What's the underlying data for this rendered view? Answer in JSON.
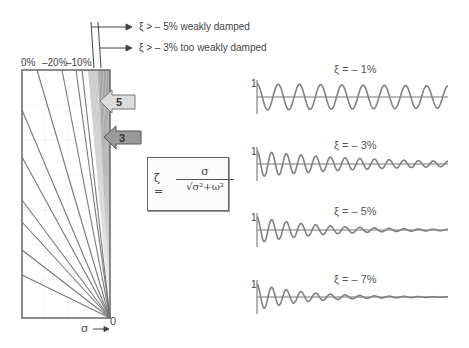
{
  "diagram": {
    "top_labels": {
      "weakly_damped": "ξ > – 5% weakly damped",
      "too_weakly_damped": "ξ > – 3% too weakly damped"
    },
    "ratio_labels": {
      "zero": "0%",
      "minus20": "–20%",
      "minus10": "–10%"
    },
    "arrow_labels": {
      "five": "5",
      "three": "3"
    },
    "axis": {
      "sigma_label": "σ",
      "origin_label": "0"
    },
    "formula": {
      "lhs": "ζ =",
      "numerator": "σ",
      "denominator": "√σ²+ω²"
    },
    "colors": {
      "line": "#777777",
      "frame": "#666666",
      "arrow_light": "#dcdcdc",
      "arrow_dark": "#9a9a9a",
      "shade": "#8a8a8a"
    }
  },
  "chart_data": [
    {
      "type": "line",
      "title": "ξ = – 1%",
      "damping_percent": -1,
      "y_tick": "1",
      "cycles": 9,
      "amplitude_end_fraction": 0.85
    },
    {
      "type": "line",
      "title": "ξ = – 3%",
      "damping_percent": -3,
      "y_tick": "1",
      "cycles": 13,
      "amplitude_end_fraction": 0.2
    },
    {
      "type": "line",
      "title": "ξ = – 5%",
      "damping_percent": -5,
      "y_tick": "1",
      "cycles": 13,
      "amplitude_end_fraction": 0.05
    },
    {
      "type": "line",
      "title": "ξ = – 7%",
      "damping_percent": -7,
      "y_tick": "1",
      "cycles": 13,
      "amplitude_end_fraction": 0.02
    }
  ]
}
